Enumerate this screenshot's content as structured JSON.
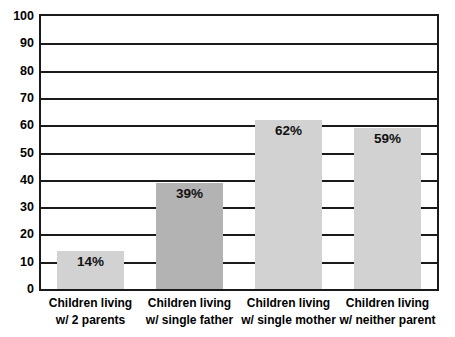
{
  "chart_data": {
    "type": "bar",
    "title": "",
    "subtitle": "",
    "xlabel": "",
    "ylabel": "",
    "ylim": [
      0,
      100
    ],
    "ytick_interval": 10,
    "yticks": [
      "100",
      "90",
      "80",
      "70",
      "60",
      "50",
      "40",
      "30",
      "20",
      "10",
      "0"
    ],
    "grid": true,
    "legend": false,
    "legend_position": "none",
    "categories": [
      "Children living\nw/ 2 parents",
      "Children living\nw/ single father",
      "Children living\nw/ single mother",
      "Children living\nw/ neither parent"
    ],
    "category_lines": [
      [
        "Children living",
        "w/ 2 parents"
      ],
      [
        "Children living",
        "w/ single father"
      ],
      [
        "Children living",
        "w/ single mother"
      ],
      [
        "Children living",
        "w/ neither parent"
      ]
    ],
    "values": [
      14,
      39,
      62,
      59
    ],
    "data_labels": [
      "14%",
      "39%",
      "62%",
      "59%"
    ],
    "bar_colors": [
      "#d2d2d2",
      "#b3b3b3",
      "#d2d2d2",
      "#d2d2d2"
    ]
  },
  "style": {
    "axis_color": "#1a1a1a",
    "grid_color": "#1a1a1a",
    "text_color": "#000000",
    "background": "#ffffff"
  }
}
